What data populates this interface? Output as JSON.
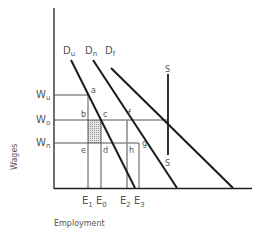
{
  "diagram": {
    "axes": {
      "y_label": "Wages",
      "x_label": "Employment"
    },
    "wage_levels": [
      {
        "id": "Wu",
        "main": "W",
        "sub": "u"
      },
      {
        "id": "Wo",
        "main": "W",
        "sub": "o"
      },
      {
        "id": "Wn",
        "main": "W",
        "sub": "n"
      }
    ],
    "employment_levels": [
      {
        "id": "E1",
        "main": "E",
        "sub": "1"
      },
      {
        "id": "E0",
        "main": "E",
        "sub": "0"
      },
      {
        "id": "E2",
        "main": "E",
        "sub": "2"
      },
      {
        "id": "E3",
        "main": "E",
        "sub": "3"
      }
    ],
    "demand_curves": [
      {
        "id": "Du",
        "main": "D",
        "sub": "u"
      },
      {
        "id": "Dn",
        "main": "D",
        "sub": "n"
      },
      {
        "id": "Df",
        "main": "D",
        "sub": "f"
      }
    ],
    "supply_curve": {
      "top_label": "S",
      "bottom_label": "S"
    },
    "points": {
      "a": "a",
      "b": "b",
      "c": "c",
      "d": "d",
      "e": "e",
      "f": "f",
      "g": "g",
      "h": "h"
    },
    "colors": {
      "line": "#1a1a1a",
      "guide": "#555555",
      "shade": "#cfcfcf"
    }
  }
}
